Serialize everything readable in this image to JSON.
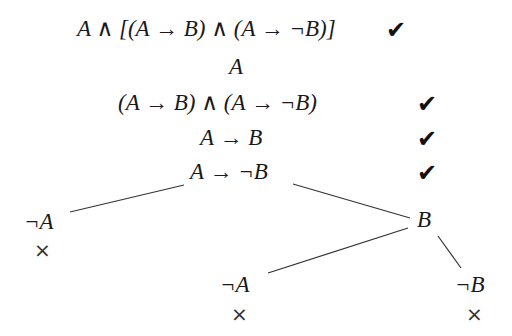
{
  "diagram": {
    "type": "truth-tree",
    "trunk": [
      {
        "formula": "A ∧ [(A → B) ∧ (A → ¬B)]",
        "checked": true
      },
      {
        "formula": "A",
        "checked": false
      },
      {
        "formula": "(A → B) ∧ (A → ¬B)",
        "checked": true
      },
      {
        "formula": "A → B",
        "checked": true
      },
      {
        "formula": "A → ¬B",
        "checked": true
      }
    ],
    "branches": {
      "left": {
        "formula": "¬A",
        "closed": true
      },
      "right": {
        "formula": "B",
        "children": [
          {
            "formula": "¬A",
            "closed": true
          },
          {
            "formula": "¬B",
            "closed": true
          }
        ]
      }
    },
    "check_mark": "✔",
    "close_mark": "×"
  }
}
